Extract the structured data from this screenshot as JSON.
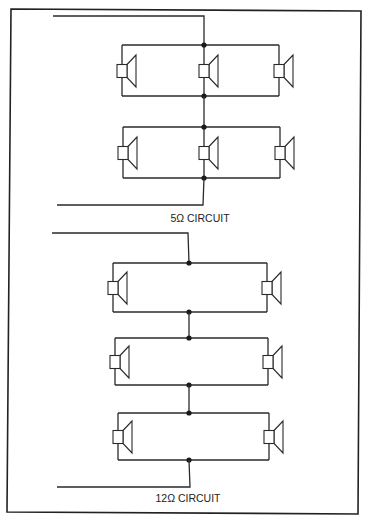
{
  "figure": {
    "frame": {
      "points": [
        [
          11,
          9
        ],
        [
          361,
          11
        ],
        [
          358,
          514
        ],
        [
          7,
          512
        ]
      ]
    },
    "circuits": [
      {
        "id": "circuit-5-ohm",
        "label": "5Ω CIRCUIT",
        "label_pos": [
          200,
          222
        ],
        "input_wire": {
          "x1": 53,
          "x2": 204,
          "y": 16
        },
        "output_wire": {
          "x1": 57,
          "x2": 203,
          "y": 205
        },
        "spine_x": 204,
        "groups": [
          {
            "top": 45,
            "bottom": 96,
            "left": 122,
            "right": 279,
            "speakers_x": [
              122,
              204,
              279
            ],
            "speaker_y": 71
          },
          {
            "top": 127,
            "bottom": 178,
            "left": 123,
            "right": 280,
            "speakers_x": [
              123,
              204,
              280
            ],
            "speaker_y": 153
          }
        ]
      },
      {
        "id": "circuit-12-ohm",
        "label": "12Ω CIRCUIT",
        "label_pos": [
          188,
          502
        ],
        "input_wire": {
          "x1": 52,
          "x2": 188,
          "y": 233
        },
        "output_wire": {
          "x1": 57,
          "x2": 190,
          "y": 487
        },
        "spine_x": 189,
        "groups": [
          {
            "top": 263,
            "bottom": 312,
            "left": 113,
            "right": 267,
            "speakers_x": [
              113,
              267
            ],
            "speaker_y": 288
          },
          {
            "top": 338,
            "bottom": 385,
            "left": 115,
            "right": 268,
            "speakers_x": [
              115,
              268
            ],
            "speaker_y": 362
          },
          {
            "top": 413,
            "bottom": 460,
            "left": 118,
            "right": 269,
            "speakers_x": [
              118,
              269
            ],
            "speaker_y": 437
          }
        ]
      }
    ],
    "speaker_symbol": {
      "box_w": 10,
      "box_h": 13,
      "cone_w": 9,
      "cone_h": 32
    }
  }
}
